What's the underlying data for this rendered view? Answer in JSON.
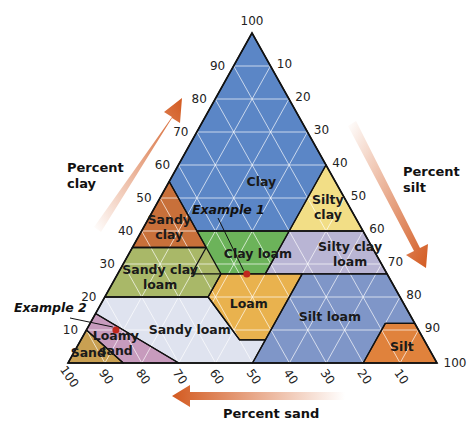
{
  "chart_data": {
    "type": "ternary",
    "title": "",
    "vertices": {
      "apex": "clay 100",
      "bottom_left": "sand 100",
      "bottom_right": "silt 100"
    },
    "axes": {
      "clay": {
        "title": [
          "Percent",
          "clay"
        ],
        "ticks": [
          10,
          20,
          30,
          40,
          50,
          60,
          70,
          80,
          90,
          100
        ]
      },
      "silt": {
        "title": [
          "Percent",
          "silt"
        ],
        "ticks": [
          10,
          20,
          30,
          40,
          50,
          60,
          70,
          80,
          90,
          100
        ]
      },
      "sand": {
        "title": [
          "Percent sand"
        ],
        "ticks": [
          100,
          90,
          80,
          70,
          60,
          50,
          40,
          30,
          20,
          10
        ]
      }
    },
    "regions": [
      {
        "name": "Clay",
        "label": [
          "Clay"
        ],
        "color": "#5b86c6",
        "poly": [
          [
            100,
            0
          ],
          [
            40,
            0
          ],
          [
            40,
            15
          ],
          [
            45,
            15
          ],
          [
            55,
            0
          ],
          [
            60,
            40
          ],
          [
            40,
            40
          ]
        ],
        "label_pos": [
          55,
          25
        ]
      },
      {
        "name": "Sandy clay",
        "label": [
          "Sandy",
          "clay"
        ],
        "color": "#c8703a",
        "label_pos": [
          41,
          7
        ]
      },
      {
        "name": "Silty clay",
        "label": [
          "Silty",
          "clay"
        ],
        "color": "#f2de86",
        "label_pos": [
          47,
          47
        ]
      },
      {
        "name": "Clay loam",
        "label": [
          "Clay loam"
        ],
        "color": "#6cb35a",
        "label_pos": [
          33,
          35
        ]
      },
      {
        "name": "Silty clay loam",
        "label": [
          "Silty clay",
          "loam"
        ],
        "color": "#b9b5d4",
        "label_pos": [
          33,
          60
        ]
      },
      {
        "name": "Sandy clay loam",
        "label": [
          "Sandy clay",
          "loam"
        ],
        "color": "#a9b868",
        "label_pos": [
          26,
          12
        ]
      },
      {
        "name": "Loam",
        "label": [
          "Loam"
        ],
        "color": "#e9b24e",
        "label_pos": [
          18,
          40
        ]
      },
      {
        "name": "Silt loam",
        "label": [
          "Silt loam"
        ],
        "color": "#7f96c8",
        "label_pos": [
          14,
          64
        ]
      },
      {
        "name": "Silt",
        "label": [
          "Silt"
        ],
        "color": "#e0823c",
        "label_pos": [
          5,
          88
        ]
      },
      {
        "name": "Sandy loam",
        "label": [
          "Sandy loam"
        ],
        "color": "#dfe3ef",
        "label_pos": [
          10,
          28
        ]
      },
      {
        "name": "Loamy sand",
        "label": [
          "Loamy",
          "sand"
        ],
        "color": "#c79bbd",
        "label_pos": [
          6,
          10
        ]
      },
      {
        "name": "Sand",
        "label": [
          "Sand"
        ],
        "color": "#c9a052",
        "label_pos": [
          3,
          4
        ]
      }
    ],
    "annotations": [
      {
        "text": "Example 1",
        "point": {
          "clay": 27,
          "silt": 35,
          "sand": 38
        }
      },
      {
        "text": "Example 2",
        "point": {
          "clay": 10,
          "silt": 8,
          "sand": 82
        }
      }
    ],
    "grid": true
  },
  "colors": {
    "arrow": "#d35a20",
    "outline": "#111111",
    "grid": "#ffffff",
    "example_dot": "#c0281e"
  }
}
